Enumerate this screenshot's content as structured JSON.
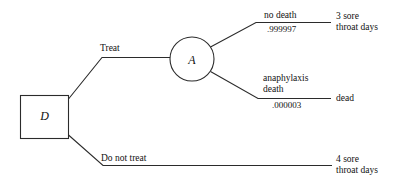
{
  "diagram": {
    "type": "decision-tree",
    "title": "",
    "background_color": "#ffffff",
    "line_color": "#2b2b2b",
    "text_color": "#111111"
  },
  "nodes": {
    "decision": {
      "label": "D",
      "shape": "rectangle",
      "role": "decision-node"
    },
    "chance": {
      "label": "A",
      "shape": "circle",
      "role": "chance-node"
    }
  },
  "branches": {
    "treat": {
      "label": "Treat"
    },
    "do_not_treat": {
      "label": "Do not treat"
    },
    "no_death": {
      "label": "no death",
      "probability": ".999997"
    },
    "anaphylaxis_death": {
      "label_line1": "anaphylaxis",
      "label_line2": "death",
      "probability": ".000003"
    }
  },
  "outcomes": {
    "treat_survive": {
      "line1": "3 sore",
      "line2": "throat days"
    },
    "treat_dead": {
      "line1": "dead"
    },
    "no_treat": {
      "line1": "4 sore",
      "line2": "throat days"
    }
  }
}
